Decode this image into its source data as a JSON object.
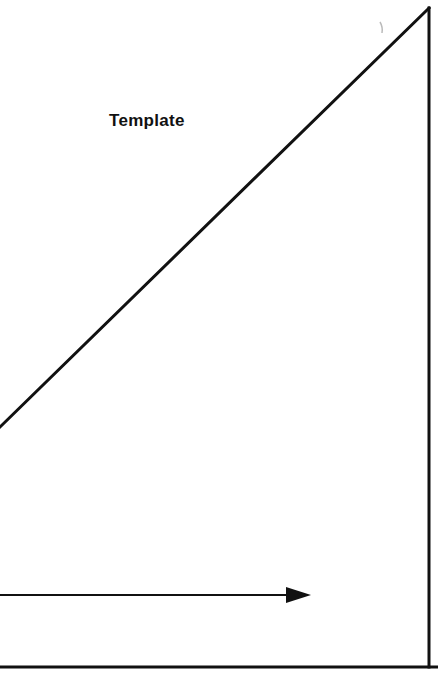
{
  "figure": {
    "title": "Template",
    "background_color": "#ffffff",
    "ink_color": "#111111",
    "width": 438,
    "height": 689
  },
  "labels": {
    "template": "Template"
  },
  "geometry": {
    "hypotenuse": {
      "name": "diagonal-line",
      "x1": 0,
      "y1": 427,
      "x2": 429,
      "y2": 8,
      "stroke_width": 3
    },
    "right_edge": {
      "name": "vertical-line",
      "x1": 429,
      "y1": 8,
      "x2": 429,
      "y2": 667,
      "stroke_width": 3
    },
    "baseline": {
      "name": "horizontal-baseline",
      "x1": 0,
      "y1": 667,
      "x2": 438,
      "y2": 667,
      "stroke_width": 3
    },
    "arrow": {
      "name": "direction-arrow",
      "x1": 0,
      "y1": 595,
      "x2": 287,
      "y2": 595,
      "tip_x": 311,
      "head_half_height": 8,
      "stroke_width": 2
    },
    "scan_artifact": {
      "name": "scan-speck",
      "x": 381,
      "y": 28
    }
  }
}
